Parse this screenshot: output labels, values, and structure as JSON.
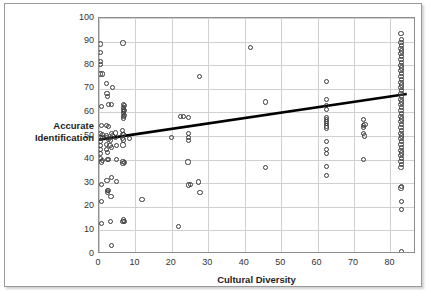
{
  "chart_data": {
    "type": "scatter",
    "title": "",
    "xlabel": "Cultural Diversity",
    "ylabel": "Accurate Identification",
    "xlim": [
      0,
      87
    ],
    "ylim": [
      0,
      100
    ],
    "xticks": [
      0,
      10,
      20,
      30,
      40,
      50,
      60,
      70,
      80
    ],
    "yticks": [
      0,
      10,
      20,
      30,
      40,
      50,
      60,
      70,
      80,
      90,
      100
    ],
    "grid": "both",
    "legend": "none",
    "marker": "open-circle",
    "marker_color": "#3a3a3a",
    "trendline": {
      "type": "linear",
      "color": "#000000",
      "width": 2.6,
      "x_start": 0.0,
      "y_start": 48.0,
      "x_end": 85.0,
      "y_end": 67.5
    },
    "points": [
      [
        0.5,
        89.0
      ],
      [
        0.5,
        85.5
      ],
      [
        0.5,
        81.5
      ],
      [
        0.5,
        80.3
      ],
      [
        0.5,
        76.3
      ],
      [
        0.9,
        76.3
      ],
      [
        0.6,
        62.5
      ],
      [
        0.6,
        54.3
      ],
      [
        0.5,
        51.0
      ],
      [
        0.9,
        50.6
      ],
      [
        0.5,
        49.5
      ],
      [
        0.9,
        49.3
      ],
      [
        0.5,
        47.5
      ],
      [
        0.5,
        46.0
      ],
      [
        0.5,
        44.3
      ],
      [
        0.5,
        42.5
      ],
      [
        0.5,
        40.3
      ],
      [
        0.9,
        39.5
      ],
      [
        0.6,
        39.0
      ],
      [
        0.6,
        29.6
      ],
      [
        0.6,
        22.2
      ],
      [
        0.6,
        13.0
      ],
      [
        2.0,
        72.3
      ],
      [
        2.2,
        68.0
      ],
      [
        2.3,
        66.6
      ],
      [
        2.6,
        63.3
      ],
      [
        2.0,
        54.5
      ],
      [
        2.6,
        54.0
      ],
      [
        2.1,
        50.3
      ],
      [
        2.2,
        49.4
      ],
      [
        2.5,
        48.6
      ],
      [
        2.0,
        46.5
      ],
      [
        2.1,
        44.4
      ],
      [
        2.3,
        43.0
      ],
      [
        2.4,
        40.0
      ],
      [
        2.6,
        39.9
      ],
      [
        2.2,
        31.2
      ],
      [
        2.4,
        27.0
      ],
      [
        2.6,
        26.8
      ],
      [
        2.3,
        26.2
      ],
      [
        3.6,
        70.4
      ],
      [
        3.5,
        63.5
      ],
      [
        3.4,
        51.0
      ],
      [
        3.6,
        50.0
      ],
      [
        3.2,
        48.0
      ],
      [
        3.0,
        46.0
      ],
      [
        3.5,
        45.2
      ],
      [
        3.4,
        32.3
      ],
      [
        3.3,
        24.5
      ],
      [
        3.2,
        13.6
      ],
      [
        3.5,
        3.5
      ],
      [
        4.8,
        46.0
      ],
      [
        4.6,
        49.2
      ],
      [
        4.5,
        51.3
      ],
      [
        4.7,
        40.0
      ],
      [
        4.9,
        30.7
      ],
      [
        6.6,
        89.4
      ],
      [
        6.7,
        63.2
      ],
      [
        6.7,
        62.2
      ],
      [
        6.7,
        61.2
      ],
      [
        6.7,
        60.3
      ],
      [
        6.7,
        59.4
      ],
      [
        6.7,
        58.4
      ],
      [
        6.7,
        57.4
      ],
      [
        6.9,
        62.8
      ],
      [
        6.9,
        60.8
      ],
      [
        6.9,
        58.8
      ],
      [
        6.5,
        52.2
      ],
      [
        6.6,
        50.7
      ],
      [
        6.8,
        50.5
      ],
      [
        6.5,
        49.0
      ],
      [
        6.8,
        48.3
      ],
      [
        6.6,
        46.2
      ],
      [
        6.6,
        39.3
      ],
      [
        6.6,
        38.2
      ],
      [
        6.9,
        38.6
      ],
      [
        6.6,
        13.9
      ],
      [
        6.9,
        13.6
      ],
      [
        6.7,
        14.4
      ],
      [
        8.3,
        48.8
      ],
      [
        11.8,
        23.1
      ],
      [
        19.8,
        49.2
      ],
      [
        21.9,
        11.8
      ],
      [
        22.3,
        58.3
      ],
      [
        23.1,
        58.2
      ],
      [
        24.6,
        58.0
      ],
      [
        24.6,
        51.0
      ],
      [
        24.6,
        49.3
      ],
      [
        24.6,
        48.0
      ],
      [
        24.4,
        39.0
      ],
      [
        24.6,
        29.2
      ],
      [
        25.2,
        29.4
      ],
      [
        27.6,
        75.3
      ],
      [
        27.4,
        30.5
      ],
      [
        27.7,
        26.2
      ],
      [
        41.5,
        87.4
      ],
      [
        45.6,
        64.4
      ],
      [
        45.6,
        36.5
      ],
      [
        62.4,
        73.0
      ],
      [
        62.5,
        65.3
      ],
      [
        62.5,
        63.0
      ],
      [
        62.5,
        61.4
      ],
      [
        62.5,
        58.0
      ],
      [
        62.5,
        57.0
      ],
      [
        62.5,
        56.2
      ],
      [
        62.5,
        55.2
      ],
      [
        62.5,
        54.2
      ],
      [
        62.5,
        53.4
      ],
      [
        62.5,
        47.6
      ],
      [
        62.5,
        44.2
      ],
      [
        62.5,
        42.5
      ],
      [
        62.5,
        37.2
      ],
      [
        62.5,
        33.1
      ],
      [
        72.6,
        57.0
      ],
      [
        73.0,
        55.0
      ],
      [
        72.6,
        54.3
      ],
      [
        72.6,
        53.6
      ],
      [
        72.6,
        51.0
      ],
      [
        72.8,
        50.0
      ],
      [
        72.6,
        40.2
      ],
      [
        82.9,
        93.3
      ],
      [
        83.0,
        91.0
      ],
      [
        82.9,
        89.6
      ],
      [
        83.1,
        88.4
      ],
      [
        82.9,
        87.2
      ],
      [
        83.0,
        86.0
      ],
      [
        82.9,
        84.8
      ],
      [
        83.1,
        83.6
      ],
      [
        82.9,
        82.4
      ],
      [
        83.0,
        81.2
      ],
      [
        82.9,
        80.0
      ],
      [
        83.1,
        78.8
      ],
      [
        82.9,
        77.6
      ],
      [
        83.0,
        76.4
      ],
      [
        82.9,
        75.2
      ],
      [
        83.1,
        74.0
      ],
      [
        82.9,
        72.8
      ],
      [
        83.0,
        71.6
      ],
      [
        82.9,
        70.4
      ],
      [
        83.1,
        69.2
      ],
      [
        82.9,
        68.0
      ],
      [
        83.0,
        66.8
      ],
      [
        82.9,
        65.6
      ],
      [
        83.1,
        64.4
      ],
      [
        82.9,
        63.2
      ],
      [
        83.0,
        62.0
      ],
      [
        82.9,
        60.8
      ],
      [
        83.1,
        59.6
      ],
      [
        82.9,
        58.4
      ],
      [
        83.0,
        57.2
      ],
      [
        82.9,
        56.0
      ],
      [
        83.1,
        54.8
      ],
      [
        82.9,
        53.6
      ],
      [
        83.0,
        52.4
      ],
      [
        82.9,
        51.2
      ],
      [
        83.1,
        50.0
      ],
      [
        82.9,
        48.8
      ],
      [
        83.0,
        47.6
      ],
      [
        82.9,
        46.4
      ],
      [
        83.1,
        45.2
      ],
      [
        82.9,
        44.0
      ],
      [
        83.0,
        42.8
      ],
      [
        82.9,
        41.6
      ],
      [
        83.1,
        40.4
      ],
      [
        82.9,
        39.2
      ],
      [
        83.0,
        38.0
      ],
      [
        82.9,
        36.8
      ],
      [
        83.0,
        28.6
      ],
      [
        82.9,
        28.0
      ],
      [
        83.0,
        22.3
      ],
      [
        83.0,
        19.0
      ],
      [
        83.1,
        1.0
      ]
    ]
  }
}
